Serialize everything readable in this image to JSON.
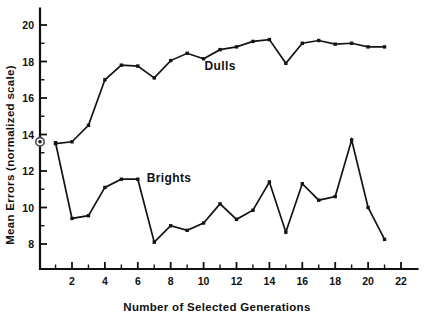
{
  "chart_data": {
    "type": "line",
    "title": "",
    "xlabel": "Number of Selected Generations",
    "ylabel": "Mean Errors  (normalized scale)",
    "xlim": [
      0,
      23
    ],
    "ylim": [
      7.0,
      20.9
    ],
    "grid": false,
    "legend_position": "inline-annotations",
    "x_ticks_major": [
      2,
      4,
      6,
      8,
      10,
      12,
      14,
      16,
      18,
      20,
      22
    ],
    "x_ticks_minor": [
      1,
      3,
      5,
      7,
      9,
      11,
      13,
      15,
      17,
      19,
      21
    ],
    "y_ticks_major": [
      8,
      10,
      12,
      14,
      16,
      18,
      20
    ],
    "y_ticks_minor": [
      9,
      11,
      13,
      15,
      17,
      19
    ],
    "x": [
      1,
      2,
      3,
      4,
      5,
      6,
      7,
      8,
      9,
      10,
      11,
      12,
      13,
      14,
      15,
      16,
      17,
      18,
      19,
      20,
      21
    ],
    "series": [
      {
        "name": "Dulls",
        "label": "Dulls",
        "label_x": 11.0,
        "label_y": 17.55,
        "color": "#141414",
        "values": [
          13.5,
          13.6,
          14.5,
          17.0,
          17.8,
          17.75,
          17.1,
          18.05,
          18.45,
          18.15,
          18.65,
          18.8,
          19.1,
          19.2,
          17.9,
          19.0,
          19.15,
          18.95,
          19.0,
          18.8,
          18.8
        ]
      },
      {
        "name": "Brights",
        "label": "Brights",
        "label_x": 7.9,
        "label_y": 11.4,
        "color": "#141414",
        "values": [
          13.55,
          9.4,
          9.55,
          11.1,
          11.55,
          11.55,
          8.1,
          9.0,
          8.75,
          9.15,
          10.2,
          9.35,
          9.85,
          11.4,
          8.65,
          11.3,
          10.4,
          10.6,
          13.7,
          10.0,
          8.25
        ]
      }
    ],
    "control_marker": {
      "name": "control-point",
      "x": 0,
      "y": 13.6
    }
  }
}
